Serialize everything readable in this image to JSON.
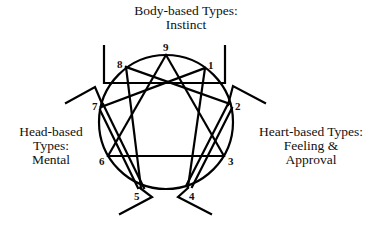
{
  "diagram": {
    "type": "enneagram",
    "groups": {
      "body": {
        "line1": "Body-based Types:",
        "line2": "Instinct",
        "types": [
          8,
          9,
          1
        ]
      },
      "head": {
        "line1": "Head-based",
        "line2": "Types:",
        "line3": "Mental",
        "types": [
          5,
          6,
          7
        ]
      },
      "heart": {
        "line1": "Heart-based Types:",
        "line2": "Feeling &",
        "line3": "Approval",
        "types": [
          2,
          3,
          4
        ]
      }
    },
    "points": {
      "p9": "9",
      "p1": "1",
      "p2": "2",
      "p3": "3",
      "p4": "4",
      "p5": "5",
      "p6": "6",
      "p7": "7",
      "p8": "8"
    },
    "connections": {
      "triangle": [
        [
          9,
          3
        ],
        [
          3,
          6
        ],
        [
          6,
          9
        ]
      ],
      "hexad": [
        [
          1,
          4
        ],
        [
          4,
          2
        ],
        [
          2,
          8
        ],
        [
          8,
          5
        ],
        [
          5,
          7
        ],
        [
          7,
          1
        ]
      ]
    },
    "colors": {
      "stroke": "#000000",
      "background": "#ffffff"
    }
  }
}
